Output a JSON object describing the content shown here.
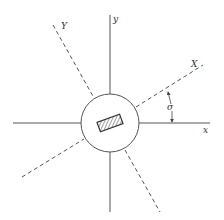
{
  "diagram": {
    "type": "rotated-coordinate-axes",
    "labels": {
      "x_axis": "x",
      "y_axis": "y",
      "X_axis": "X",
      "Y_axis": "Y",
      "angle": "σ"
    },
    "colors": {
      "line": "#555555",
      "background": "#ffffff"
    }
  }
}
